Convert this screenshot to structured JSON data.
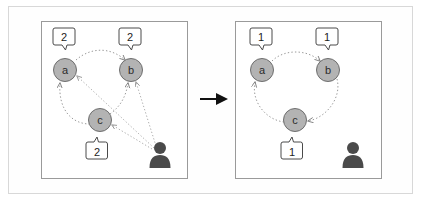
{
  "figure": {
    "background_color": "#ffffff",
    "frame_border_color": "#d8d8d8"
  },
  "transition": {
    "arrow_icon": "arrow-right-icon",
    "arrow_color": "#111111"
  },
  "style": {
    "node_fill": "#b3b3b3",
    "node_stroke": "#6e6e6e",
    "edge_color": "#8c8c8c",
    "edge_style": "dotted",
    "panel_border": "#9a9a9a",
    "callout_border": "#4a4a4a",
    "callout_fill": "#ffffff",
    "person_color": "#4a4a4a"
  },
  "panels": [
    {
      "id": "before",
      "name": "before-panel",
      "nodes": [
        {
          "id": "a",
          "label": "a",
          "counter": "2",
          "cx": 65,
          "cy": 70
        },
        {
          "id": "b",
          "label": "b",
          "counter": "2",
          "cx": 131,
          "cy": 70
        },
        {
          "id": "c",
          "label": "c",
          "counter": "2",
          "cx": 100,
          "cy": 120
        }
      ],
      "person": {
        "icon": "person-icon",
        "cx": 160,
        "cy": 155
      },
      "edges": [
        {
          "from": "a",
          "to": "b",
          "kind": "curve"
        },
        {
          "from": "c",
          "to": "a",
          "kind": "curve"
        },
        {
          "from": "c",
          "to": "b",
          "kind": "curve"
        },
        {
          "from": "person",
          "to": "a",
          "kind": "straight"
        },
        {
          "from": "person",
          "to": "b",
          "kind": "straight"
        },
        {
          "from": "person",
          "to": "c",
          "kind": "straight"
        }
      ]
    },
    {
      "id": "after",
      "name": "after-panel",
      "nodes": [
        {
          "id": "a",
          "label": "a",
          "counter": "1",
          "cx": 262,
          "cy": 70
        },
        {
          "id": "b",
          "label": "b",
          "counter": "1",
          "cx": 328,
          "cy": 70
        },
        {
          "id": "c",
          "label": "c",
          "counter": "1",
          "cx": 295,
          "cy": 120
        }
      ],
      "person": {
        "icon": "person-icon",
        "cx": 353,
        "cy": 155
      },
      "edges": [
        {
          "from": "a",
          "to": "b",
          "kind": "curve"
        },
        {
          "from": "b",
          "to": "c",
          "kind": "curve"
        },
        {
          "from": "c",
          "to": "a",
          "kind": "curve"
        }
      ]
    }
  ],
  "labels": {
    "before": {
      "node_a": "a",
      "node_b": "b",
      "node_c": "c",
      "counter_a": "2",
      "counter_b": "2",
      "counter_c": "2"
    },
    "after": {
      "node_a": "a",
      "node_b": "b",
      "node_c": "c",
      "counter_a": "1",
      "counter_b": "1",
      "counter_c": "1"
    }
  }
}
